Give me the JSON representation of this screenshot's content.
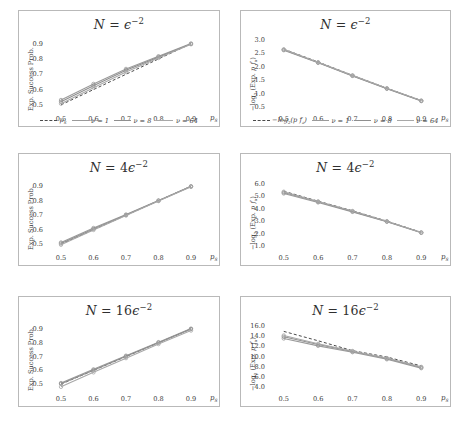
{
  "figure": {
    "rows": 3,
    "cols": 2,
    "xlabel": "p_S",
    "left_ylabel": "Exp. Success Prob.",
    "right_ylabel": "−log₂ (Exp. p fₐ)",
    "colors": {
      "baseline": "#4a4a4a",
      "nu1": "#9a9a9a",
      "nu8": "#8f8f8f",
      "nu64": "#a8a8a8",
      "axis": "#b9b9b9",
      "text": "#3d3d3d",
      "background": "#ffffff"
    }
  },
  "legend": {
    "left": {
      "entries": [
        {
          "label": "p_S",
          "style": "dashed",
          "color": "#4a4a4a"
        },
        {
          "label": "ν = 1",
          "style": "solid",
          "color": "#9a9a9a"
        },
        {
          "label": "ν = 8",
          "style": "solid",
          "color": "#8f8f8f"
        },
        {
          "label": "ν = 64",
          "style": "solid",
          "color": "#a8a8a8"
        }
      ]
    },
    "right": {
      "entries": [
        {
          "label": "−log₂(p fₐ)",
          "style": "dashed",
          "color": "#4a4a4a"
        },
        {
          "label": "ν = 1",
          "style": "solid",
          "color": "#9a9a9a"
        },
        {
          "label": "ν = 8",
          "style": "solid",
          "color": "#8f8f8f"
        },
        {
          "label": "ν = 64",
          "style": "solid",
          "color": "#a8a8a8"
        }
      ]
    }
  },
  "chart_data": [
    {
      "type": "line",
      "panel": "top-left",
      "title": "N = ε⁻²",
      "title_parts": {
        "lhs": "N",
        "eq": "=",
        "coef": "",
        "base": "ϵ",
        "exp": "−2"
      },
      "xlabel": "p_S",
      "ylabel": "Exp. Success Prob.",
      "x": [
        0.5,
        0.6,
        0.7,
        0.8,
        0.9
      ],
      "xlim": [
        0.46,
        0.94
      ],
      "ylim": [
        0.46,
        0.95
      ],
      "xticks": [
        "0.5",
        "0.6",
        "0.7",
        "0.8",
        "0.9"
      ],
      "yticks": [
        "0.5",
        "0.6",
        "0.7",
        "0.8",
        "0.9"
      ],
      "grid": false,
      "series": [
        {
          "name": "p_S",
          "style": "dashed",
          "color": "#4a4a4a",
          "values": [
            0.5,
            0.6,
            0.7,
            0.8,
            0.9
          ]
        },
        {
          "name": "ν = 1",
          "style": "solid",
          "color": "#9a9a9a",
          "values": [
            0.532,
            0.637,
            0.735,
            0.818,
            0.901
          ]
        },
        {
          "name": "ν = 8",
          "style": "solid",
          "color": "#8f8f8f",
          "values": [
            0.52,
            0.625,
            0.726,
            0.812,
            0.898
          ]
        },
        {
          "name": "ν = 64",
          "style": "solid",
          "color": "#a8a8a8",
          "values": [
            0.508,
            0.612,
            0.714,
            0.806,
            0.896
          ]
        }
      ]
    },
    {
      "type": "line",
      "panel": "top-right",
      "title": "N = ε⁻²",
      "title_parts": {
        "lhs": "N",
        "eq": "=",
        "coef": "",
        "base": "ϵ",
        "exp": "−2"
      },
      "xlabel": "p_S",
      "ylabel": "−log₂ (Exp. p fₐ)",
      "x": [
        0.5,
        0.6,
        0.7,
        0.8,
        0.9
      ],
      "xlim": [
        0.46,
        0.94
      ],
      "ylim": [
        0.35,
        3.15
      ],
      "xticks": [
        "0.5",
        "0.6",
        "0.7",
        "0.8",
        "0.9"
      ],
      "yticks": [
        "0.5",
        "1.0",
        "1.5",
        "2.0",
        "2.5",
        "3.0"
      ],
      "grid": false,
      "series": [
        {
          "name": "−log₂(p fₐ)",
          "style": "dashed",
          "color": "#4a4a4a",
          "values": [
            2.66,
            2.18,
            1.68,
            1.2,
            0.74
          ]
        },
        {
          "name": "ν = 1",
          "style": "solid",
          "color": "#9a9a9a",
          "values": [
            2.62,
            2.15,
            1.66,
            1.18,
            0.72
          ]
        },
        {
          "name": "ν = 8",
          "style": "solid",
          "color": "#8f8f8f",
          "values": [
            2.64,
            2.16,
            1.67,
            1.19,
            0.73
          ]
        },
        {
          "name": "ν = 64",
          "style": "solid",
          "color": "#a8a8a8",
          "values": [
            2.65,
            2.17,
            1.68,
            1.2,
            0.74
          ]
        }
      ]
    },
    {
      "type": "line",
      "panel": "middle-left",
      "title": "N = 4ε⁻²",
      "title_parts": {
        "lhs": "N",
        "eq": "=",
        "coef": "4",
        "base": "ϵ",
        "exp": "−2"
      },
      "xlabel": "p_S",
      "ylabel": "Exp. Success Prob.",
      "x": [
        0.5,
        0.6,
        0.7,
        0.8,
        0.9
      ],
      "xlim": [
        0.46,
        0.94
      ],
      "ylim": [
        0.46,
        0.95
      ],
      "xticks": [
        "0.5",
        "0.6",
        "0.7",
        "0.8",
        "0.9"
      ],
      "yticks": [
        "0.5",
        "0.6",
        "0.7",
        "0.8",
        "0.9"
      ],
      "grid": false,
      "series": [
        {
          "name": "p_S",
          "style": "dashed",
          "color": "#4a4a4a",
          "values": [
            0.5,
            0.6,
            0.7,
            0.8,
            0.9
          ]
        },
        {
          "name": "ν = 1",
          "style": "solid",
          "color": "#9a9a9a",
          "values": [
            0.512,
            0.612,
            0.705,
            0.802,
            0.9
          ]
        },
        {
          "name": "ν = 8",
          "style": "solid",
          "color": "#8f8f8f",
          "values": [
            0.505,
            0.605,
            0.701,
            0.8,
            0.898
          ]
        },
        {
          "name": "ν = 64",
          "style": "solid",
          "color": "#a8a8a8",
          "values": [
            0.496,
            0.598,
            0.698,
            0.798,
            0.896
          ]
        }
      ]
    },
    {
      "type": "line",
      "panel": "middle-right",
      "title": "N = 4ε⁻²",
      "title_parts": {
        "lhs": "N",
        "eq": "=",
        "coef": "4",
        "base": "ϵ",
        "exp": "−2"
      },
      "xlabel": "p_S",
      "ylabel": "−log₂ (Exp. p fₐ)",
      "x": [
        0.5,
        0.6,
        0.7,
        0.8,
        0.9
      ],
      "xlim": [
        0.46,
        0.94
      ],
      "ylim": [
        0.7,
        6.4
      ],
      "xticks": [
        "0.5",
        "0.6",
        "0.7",
        "0.8",
        "0.9"
      ],
      "yticks": [
        "1.0",
        "2.0",
        "3.0",
        "4.0",
        "5.0",
        "6.0"
      ],
      "grid": false,
      "series": [
        {
          "name": "−log₂(p fₐ)",
          "style": "dashed",
          "color": "#4a4a4a",
          "values": [
            5.42,
            4.62,
            3.85,
            3.02,
            2.12
          ]
        },
        {
          "name": "ν = 1",
          "style": "solid",
          "color": "#9a9a9a",
          "values": [
            5.24,
            4.52,
            3.76,
            2.97,
            2.08
          ]
        },
        {
          "name": "ν = 8",
          "style": "solid",
          "color": "#8f8f8f",
          "values": [
            5.32,
            4.57,
            3.8,
            2.99,
            2.1
          ]
        },
        {
          "name": "ν = 64",
          "style": "solid",
          "color": "#a8a8a8",
          "values": [
            5.38,
            4.6,
            3.83,
            3.01,
            2.11
          ]
        }
      ]
    },
    {
      "type": "line",
      "panel": "bottom-left",
      "title": "N = 16ε⁻²",
      "title_parts": {
        "lhs": "N",
        "eq": "=",
        "coef": "16",
        "base": "ϵ",
        "exp": "−2"
      },
      "xlabel": "p_S",
      "ylabel": "Exp. Success Prob.",
      "x": [
        0.5,
        0.6,
        0.7,
        0.8,
        0.9
      ],
      "xlim": [
        0.46,
        0.94
      ],
      "ylim": [
        0.45,
        0.95
      ],
      "xticks": [
        "0.5",
        "0.6",
        "0.7",
        "0.8",
        "0.9"
      ],
      "yticks": [
        "0.5",
        "0.6",
        "0.7",
        "0.8",
        "0.9"
      ],
      "grid": false,
      "series": [
        {
          "name": "p_S",
          "style": "dashed",
          "color": "#4a4a4a",
          "values": [
            0.5,
            0.6,
            0.7,
            0.8,
            0.9
          ]
        },
        {
          "name": "ν = 1",
          "style": "solid",
          "color": "#9a9a9a",
          "values": [
            0.508,
            0.607,
            0.706,
            0.804,
            0.902
          ]
        },
        {
          "name": "ν = 8",
          "style": "solid",
          "color": "#8f8f8f",
          "values": [
            0.502,
            0.601,
            0.701,
            0.8,
            0.899
          ]
        },
        {
          "name": "ν = 64",
          "style": "solid",
          "color": "#a8a8a8",
          "values": [
            0.48,
            0.585,
            0.688,
            0.79,
            0.888
          ]
        }
      ]
    },
    {
      "type": "line",
      "panel": "bottom-right",
      "title": "N = 16ε⁻²",
      "title_parts": {
        "lhs": "N",
        "eq": "=",
        "coef": "16",
        "base": "ϵ",
        "exp": "−2"
      },
      "xlabel": "p_S",
      "ylabel": "−log₂ (Exp. p fₐ)",
      "x": [
        0.5,
        0.6,
        0.7,
        0.8,
        0.9
      ],
      "xlim": [
        3.2,
        16.8
      ],
      "ylim": [
        3.2,
        16.8
      ],
      "xticks": [
        "0.5",
        "0.6",
        "0.7",
        "0.8",
        "0.9"
      ],
      "yticks": [
        "4.0",
        "6.0",
        "8.0",
        "10.0",
        "12.0",
        "14.0",
        "16.0"
      ],
      "grid": false,
      "series": [
        {
          "name": "−log₂(p fₐ)",
          "style": "dashed",
          "color": "#4a4a4a",
          "values": [
            14.95,
            13.1,
            11.15,
            9.9,
            8.15
          ]
        },
        {
          "name": "ν = 1",
          "style": "solid",
          "color": "#9a9a9a",
          "values": [
            13.55,
            12.1,
            10.85,
            9.45,
            7.7
          ]
        },
        {
          "name": "ν = 8",
          "style": "solid",
          "color": "#8f8f8f",
          "values": [
            13.9,
            12.35,
            11.0,
            9.6,
            7.85
          ]
        },
        {
          "name": "ν = 64",
          "style": "solid",
          "color": "#a8a8a8",
          "values": [
            14.15,
            12.5,
            11.08,
            9.7,
            7.95
          ]
        }
      ]
    }
  ]
}
